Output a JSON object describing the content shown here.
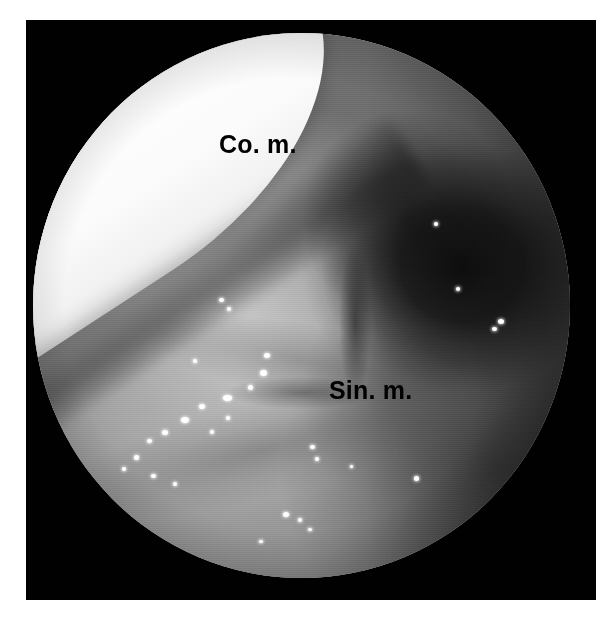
{
  "figure": {
    "type": "endoscopic-photograph",
    "modality": "nasal endoscopy",
    "frame_color": "#010101",
    "background_color": "#ffffff",
    "field_of_view_shape": "circle"
  },
  "annotations": [
    {
      "id": "co-m",
      "text": "Co. m.",
      "meaning": "concha media",
      "color": "#000000",
      "x": 219,
      "y": 132
    },
    {
      "id": "sin-m",
      "text": "Sin. m.",
      "meaning": "sinus maxillaris",
      "color": "#000000",
      "x": 329,
      "y": 378
    }
  ],
  "regions": {
    "concha_label": "Co. m.",
    "sinus_label": "Sin. m.",
    "bright_structure": "concha media",
    "dark_cavity": "posterior meatus"
  },
  "caption": {
    "sliver_text": ""
  },
  "specular_highlights": [
    {
      "x": 43.0,
      "y": 58.8,
      "w": 6,
      "h": 5
    },
    {
      "x": 42.2,
      "y": 61.8,
      "w": 7,
      "h": 6
    },
    {
      "x": 40.0,
      "y": 64.5,
      "w": 5,
      "h": 5
    },
    {
      "x": 35.3,
      "y": 66.5,
      "w": 9,
      "h": 6
    },
    {
      "x": 31.0,
      "y": 68.0,
      "w": 6,
      "h": 5
    },
    {
      "x": 27.5,
      "y": 70.5,
      "w": 8,
      "h": 6
    },
    {
      "x": 24.0,
      "y": 72.8,
      "w": 6,
      "h": 5
    },
    {
      "x": 21.3,
      "y": 74.5,
      "w": 5,
      "h": 4
    },
    {
      "x": 18.8,
      "y": 77.5,
      "w": 5,
      "h": 5
    },
    {
      "x": 16.6,
      "y": 79.6,
      "w": 4,
      "h": 4
    },
    {
      "x": 22.0,
      "y": 81.0,
      "w": 5,
      "h": 4
    },
    {
      "x": 26.0,
      "y": 82.4,
      "w": 4,
      "h": 4
    },
    {
      "x": 33.0,
      "y": 72.8,
      "w": 4,
      "h": 4
    },
    {
      "x": 36.0,
      "y": 70.2,
      "w": 4,
      "h": 4
    },
    {
      "x": 29.8,
      "y": 59.8,
      "w": 4,
      "h": 4
    },
    {
      "x": 46.5,
      "y": 87.8,
      "w": 6,
      "h": 5
    },
    {
      "x": 49.4,
      "y": 88.9,
      "w": 4,
      "h": 4
    },
    {
      "x": 51.5,
      "y": 75.6,
      "w": 5,
      "h": 4
    },
    {
      "x": 52.6,
      "y": 77.8,
      "w": 4,
      "h": 4
    },
    {
      "x": 59.0,
      "y": 79.3,
      "w": 3,
      "h": 3
    },
    {
      "x": 71.0,
      "y": 81.3,
      "w": 5,
      "h": 5
    },
    {
      "x": 86.5,
      "y": 52.5,
      "w": 6,
      "h": 5
    },
    {
      "x": 85.4,
      "y": 53.9,
      "w": 5,
      "h": 4
    },
    {
      "x": 78.7,
      "y": 46.6,
      "w": 4,
      "h": 4
    },
    {
      "x": 74.6,
      "y": 34.6,
      "w": 4,
      "h": 4
    },
    {
      "x": 34.6,
      "y": 48.7,
      "w": 5,
      "h": 4
    },
    {
      "x": 36.2,
      "y": 50.3,
      "w": 4,
      "h": 4
    },
    {
      "x": 51.2,
      "y": 90.8,
      "w": 4,
      "h": 3
    },
    {
      "x": 42.0,
      "y": 93.0,
      "w": 4,
      "h": 3
    }
  ]
}
